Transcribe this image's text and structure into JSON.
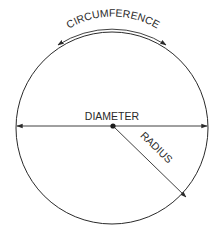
{
  "diagram": {
    "labels": {
      "circumference": "CIRCUMFERENCE",
      "diameter": "DIAMETER",
      "radius": "RADIUS"
    },
    "colors": {
      "stroke": "#2a2a2a",
      "background": "#ffffff"
    }
  }
}
